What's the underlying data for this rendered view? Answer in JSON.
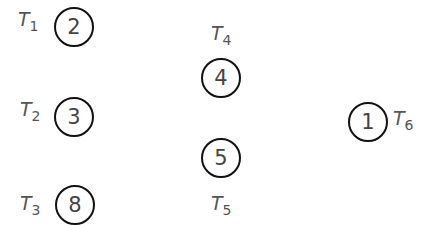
{
  "nodes": [
    {
      "id": "T1",
      "label": "T",
      "sub": "1",
      "value": "2"
    },
    {
      "id": "T2",
      "label": "T",
      "sub": "2",
      "value": "3"
    },
    {
      "id": "T3",
      "label": "T",
      "sub": "3",
      "value": "8"
    },
    {
      "id": "T4",
      "label": "T",
      "sub": "4",
      "value": "4"
    },
    {
      "id": "T5",
      "label": "T",
      "sub": "5",
      "value": "5"
    },
    {
      "id": "T6",
      "label": "T",
      "sub": "6",
      "value": "1"
    }
  ]
}
